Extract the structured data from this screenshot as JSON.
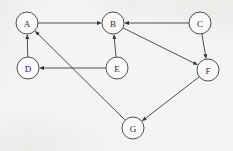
{
  "diagram": {
    "type": "directed-graph",
    "canvas": {
      "width": 233,
      "height": 151
    },
    "style": {
      "background_color": "#f5f4f2",
      "stroke_color": "#3c3c3c",
      "node_fill_color": "#fbfaf9",
      "label_color": "#2e2e2e",
      "node_radius": 11
    },
    "nodes": [
      {
        "id": "A",
        "label": "A",
        "cx": 27,
        "cy": 23,
        "r": 11
      },
      {
        "id": "B",
        "label": "B",
        "cx": 113,
        "cy": 23,
        "r": 11
      },
      {
        "id": "C",
        "label": "C",
        "cx": 200,
        "cy": 23,
        "r": 11
      },
      {
        "id": "D",
        "label": "D",
        "cx": 28,
        "cy": 68,
        "r": 11
      },
      {
        "id": "E",
        "label": "E",
        "cx": 117,
        "cy": 68,
        "r": 11
      },
      {
        "id": "F",
        "label": "F",
        "cx": 208,
        "cy": 70,
        "r": 11
      },
      {
        "id": "G",
        "label": "G",
        "cx": 133,
        "cy": 128,
        "r": 11
      }
    ],
    "edges": [
      {
        "id": "edge-a-b",
        "from": "A",
        "to": "B",
        "directed": true
      },
      {
        "id": "edge-c-b",
        "from": "C",
        "to": "B",
        "directed": true
      },
      {
        "id": "edge-e-b",
        "from": "E",
        "to": "B",
        "directed": true
      },
      {
        "id": "edge-e-d",
        "from": "E",
        "to": "D",
        "directed": true
      },
      {
        "id": "edge-d-a",
        "from": "D",
        "to": "A",
        "directed": true
      },
      {
        "id": "edge-g-a",
        "from": "G",
        "to": "A",
        "directed": true
      },
      {
        "id": "edge-b-f",
        "from": "B",
        "to": "F",
        "directed": true
      },
      {
        "id": "edge-c-f",
        "from": "C",
        "to": "F",
        "directed": true
      },
      {
        "id": "edge-f-g",
        "from": "F",
        "to": "G",
        "directed": true
      }
    ]
  }
}
